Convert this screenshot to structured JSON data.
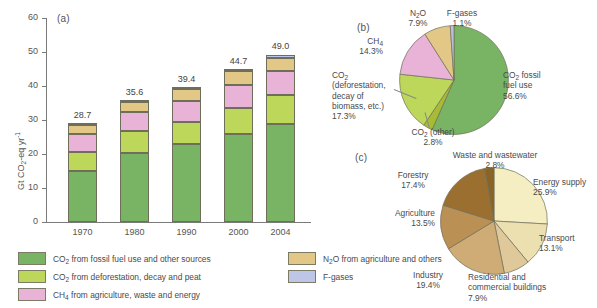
{
  "figure": {
    "panels": [
      "(a)",
      "(b)",
      "(c)"
    ]
  },
  "chart_data": [
    {
      "type": "bar",
      "panel": "(a)",
      "stacked": true,
      "title": "",
      "xlabel": "",
      "ylabel": "Gt CO2-eq yr-1",
      "ylabel_parts": {
        "pre": "Gt CO",
        "sub": "2",
        "mid": "-eq yr",
        "sup": "-1"
      },
      "categories": [
        "1970",
        "1980",
        "1990",
        "2000",
        "2004"
      ],
      "ylim": [
        0,
        60
      ],
      "yticks": [
        0,
        10,
        20,
        30,
        40,
        50,
        60
      ],
      "grid": false,
      "totals": [
        "28.7",
        "35.6",
        "39.4",
        "44.7",
        "49.0"
      ],
      "series": [
        {
          "name": "CO2 from fossil fuel use and other sources",
          "color": "#79b464",
          "values": [
            15.0,
            20.3,
            22.9,
            26.0,
            28.8
          ]
        },
        {
          "name": "CO2 from deforestation, decay and peat",
          "color": "#bcd75a",
          "values": [
            5.7,
            6.4,
            6.4,
            7.6,
            8.6
          ]
        },
        {
          "name": "CH4 from agriculture, waste and energy",
          "color": "#e9b2d7",
          "values": [
            5.2,
            5.7,
            6.3,
            6.7,
            6.9
          ]
        },
        {
          "name": "N2O from agriculture and others",
          "color": "#e3c786",
          "values": [
            2.5,
            2.9,
            3.5,
            4.0,
            4.0
          ]
        },
        {
          "name": "F-gases",
          "color": "#bec6e8",
          "values": [
            0.3,
            0.3,
            0.3,
            0.4,
            0.7
          ]
        }
      ]
    },
    {
      "type": "pie",
      "panel": "(b)",
      "title": "",
      "start_angle_deg": 0,
      "direction": "clockwise",
      "slices": [
        {
          "label": "CO2 fossil fuel use",
          "value": 56.6,
          "display": "56.6%",
          "color": "#79b464"
        },
        {
          "label": "CO2 (other)",
          "value": 2.8,
          "display": "2.8%",
          "color": "#a8bb34"
        },
        {
          "label": "CO2 (deforestation, decay of biomass, etc.)",
          "value": 17.3,
          "display": "17.3%",
          "color": "#bcd75a"
        },
        {
          "label": "CH4",
          "value": 14.3,
          "display": "14.3%",
          "color": "#e9b2d7"
        },
        {
          "label": "N2O",
          "value": 7.9,
          "display": "7.9%",
          "color": "#e3c786"
        },
        {
          "label": "F-gases",
          "value": 1.1,
          "display": "1.1%",
          "color": "#b9c1dd"
        }
      ]
    },
    {
      "type": "pie",
      "panel": "(c)",
      "title": "",
      "start_angle_deg": 0,
      "direction": "clockwise",
      "slices": [
        {
          "label": "Energy supply",
          "value": 25.9,
          "display": "25.9%",
          "color": "#f5eec2"
        },
        {
          "label": "Transport",
          "value": 13.1,
          "display": "13.1%",
          "color": "#ecdfb0"
        },
        {
          "label": "Residential and commercial buildings",
          "value": 7.9,
          "display": "7.9%",
          "color": "#dfc89a"
        },
        {
          "label": "Industry",
          "value": 19.4,
          "display": "19.4%",
          "color": "#cfac75"
        },
        {
          "label": "Agriculture",
          "value": 13.5,
          "display": "13.5%",
          "color": "#bb9055"
        },
        {
          "label": "Forestry",
          "value": 17.4,
          "display": "17.4%",
          "color": "#9a6f30"
        },
        {
          "label": "Waste and wastewater",
          "value": 2.8,
          "display": "2.8%",
          "color": "#8a6326"
        }
      ]
    }
  ],
  "bar_chart": {
    "yticks": [
      "60",
      "50",
      "40",
      "30",
      "20",
      "10",
      "0"
    ],
    "xticks": [
      "1970",
      "1980",
      "1990",
      "2000",
      "2004"
    ],
    "totals": [
      "28.7",
      "35.6",
      "39.4",
      "44.7",
      "49.0"
    ]
  },
  "legend": {
    "items": [
      {
        "color": "#79b464",
        "pre": "CO",
        "sub": "2",
        "post": " from fossil fuel use and other sources"
      },
      {
        "color": "#bcd75a",
        "pre": "CO",
        "sub": "2",
        "post": " from deforestation, decay and peat"
      },
      {
        "color": "#e9b2d7",
        "pre": "CH",
        "sub": "4",
        "post": " from agriculture, waste and energy"
      },
      {
        "color": "#e3c786",
        "pre": "N",
        "sub": "2",
        "post": "O from agriculture and others"
      },
      {
        "color": "#bec6e8",
        "pre": "F-gases",
        "sub": "",
        "post": ""
      }
    ]
  },
  "pie_b_labels": {
    "n2o_name": "N O",
    "n2o_value": "7.9%",
    "fgases_name": "F-gases",
    "fgases_value": "1.1%",
    "ch4_name": "CH",
    "ch4_value": "14.3%",
    "co2_defor_l1": "CO",
    "co2_defor_l2": "(deforestation,",
    "co2_defor_l3": "decay of",
    "co2_defor_l4": "biomass, etc.)",
    "co2_defor_value": "17.3%",
    "co2_other_name": "CO  (other)",
    "co2_other_value": "2.8%",
    "co2_fossil_l1": "CO  fossil",
    "co2_fossil_l2": "fuel use",
    "co2_fossil_value": "56.6%"
  },
  "pie_c_labels": {
    "waste_name": "Waste and wastewater",
    "waste_value": "2.8%",
    "forestry_name": "Forestry",
    "forestry_value": "17.4%",
    "agriculture_name": "Agriculture",
    "agriculture_value": "13.5%",
    "industry_name": "Industry",
    "industry_value": "19.4%",
    "residential_l1": "Residential and",
    "residential_l2": "commercial buildings",
    "residential_value": "7.9%",
    "transport_name": "Transport",
    "transport_value": "13.1%",
    "energy_name": "Energy supply",
    "energy_value": "25.9%"
  }
}
